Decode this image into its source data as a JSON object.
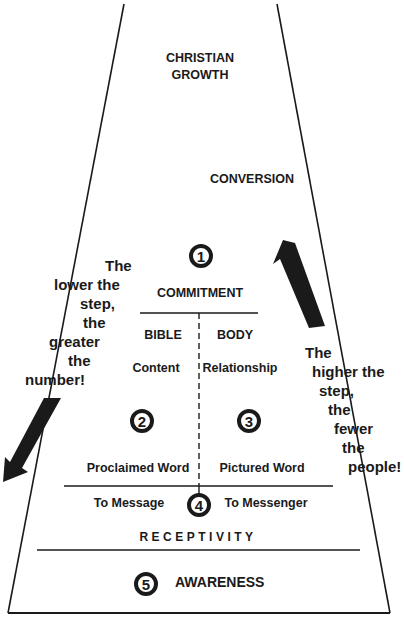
{
  "diagram": {
    "top_label": [
      "CHRISTIAN",
      "GROWTH"
    ],
    "cross_label": "CONVERSION",
    "levels": [
      {
        "number": "1",
        "title": "COMMITMENT"
      },
      {
        "number": "2",
        "heading": "BIBLE",
        "sub": "Content",
        "caption": "Proclaimed Word"
      },
      {
        "number": "3",
        "heading": "BODY",
        "sub": "Relationship",
        "caption": "Pictured Word"
      },
      {
        "number": "4",
        "left": "To Message",
        "right": "To Messenger",
        "title": "RECEPTIVITY"
      },
      {
        "number": "5",
        "title": "AWARENESS"
      }
    ],
    "left_note": [
      "The",
      "lower the",
      "step,",
      "the",
      "greater",
      "the",
      "number!"
    ],
    "right_note": [
      "The",
      "higher the",
      "step,",
      "the",
      "fewer",
      "the",
      "people!"
    ],
    "arrow_left": "down-left-arrow",
    "arrow_right": "up-left-arrow",
    "ink_color": "#1a1a1a"
  }
}
